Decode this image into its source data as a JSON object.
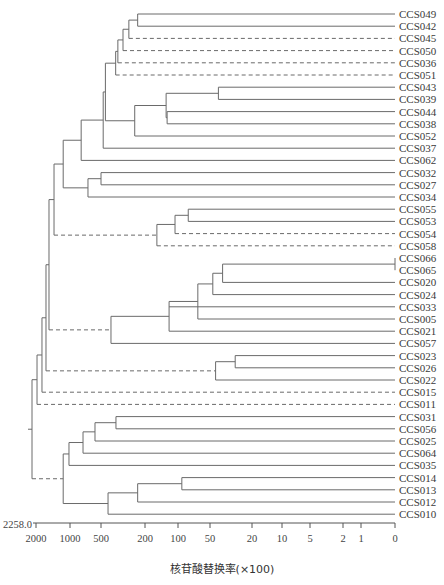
{
  "chart_data": {
    "type": "dendrogram",
    "title": "",
    "xlabel": "核苷酸替换率(×100)",
    "axis_max_label": "2258.0",
    "axis_ticks": [
      "2000",
      "1000",
      "500",
      "200",
      "100",
      "50",
      "20",
      "10",
      "5",
      "2",
      "1",
      "0"
    ],
    "leaves": [
      "CCS049",
      "CCS042",
      "CCS045",
      "CCS050",
      "CCS036",
      "CCS051",
      "CCS043",
      "CCS039",
      "CCS044",
      "CCS038",
      "CCS052",
      "CCS037",
      "CCS062",
      "CCS032",
      "CCS027",
      "CCS034",
      "CCS055",
      "CCS053",
      "CCS054",
      "CCS058",
      "CCS066",
      "CCS065",
      "CCS020",
      "CCS024",
      "CCS033",
      "CCS005",
      "CCS021",
      "CCS057",
      "CCS023",
      "CCS026",
      "CCS022",
      "CCS015",
      "CCS011",
      "CCS031",
      "CCS056",
      "CCS025",
      "CCS064",
      "CCS035",
      "CCS014",
      "CCS013",
      "CCS012",
      "CCS010"
    ],
    "tree": {
      "h": 2258,
      "c": [
        {
          "h": 1970,
          "c": [
            {
              "h": 1824,
              "c": [
                {
                  "h": 1706,
                  "c": [
                    {
                      "h": 1618,
                      "c": [
                        {
                          "h": 1470,
                          "c": [
                            {
                              "h": 1200,
                              "c": [
                                {
                                  "h": 820,
                                  "c": [
                                    {
                                      "h": 485,
                                      "c": [
                                        {
                                          "h": 470,
                                          "c": [
                                            {
                                              "h": 400,
                                              "c": [
                                                {
                                                  "h": 385,
                                                  "c": [
                                                    {
                                                      "h": 350,
                                                      "c": [
                                                        {
                                                          "h": 310,
                                                          "c": [
                                                            {
                                                              "h": 250,
                                                              "c": [
                                                                {
                                                                  "leaf": "CCS049"
                                                                },
                                                                {
                                                                  "leaf": "CCS042"
                                                                }
                                                              ]
                                                            },
                                                            {
                                                              "leaf": "CCS045",
                                                              "dashed": true
                                                            }
                                                          ]
                                                        },
                                                        {
                                                          "leaf": "CCS050",
                                                          "dashed": true
                                                        }
                                                      ]
                                                    },
                                                    {
                                                      "leaf": "CCS036",
                                                      "dashed": true
                                                    }
                                                  ]
                                                },
                                                {
                                                  "leaf": "CCS051",
                                                  "dashed": true
                                                }
                                              ]
                                            },
                                            {
                                              "h": 270,
                                              "c": [
                                                {
                                                  "h": 136,
                                                  "c": [
                                                    {
                                                      "h": 44,
                                                      "c": [
                                                        {
                                                          "leaf": "CCS043"
                                                        },
                                                        {
                                                          "leaf": "CCS039"
                                                        }
                                                      ]
                                                    },
                                                    {
                                                      "h": 133,
                                                      "c": [
                                                        {
                                                          "leaf": "CCS044"
                                                        },
                                                        {
                                                          "leaf": "CCS038"
                                                        }
                                                      ]
                                                    }
                                                  ]
                                                },
                                                {
                                                  "leaf": "CCS052"
                                                }
                                              ]
                                            }
                                          ]
                                        },
                                        {
                                          "leaf": "CCS037"
                                        }
                                      ]
                                    },
                                    {
                                      "leaf": "CCS062"
                                    }
                                  ]
                                },
                                {
                                  "h": 710,
                                  "c": [
                                    {
                                      "h": 500,
                                      "c": [
                                        {
                                          "leaf": "CCS032"
                                        },
                                        {
                                          "leaf": "CCS027"
                                        }
                                      ]
                                    },
                                    {
                                      "leaf": "CCS034"
                                    }
                                  ]
                                }
                              ]
                            },
                            {
                              "h": 164,
                              "dashed": true,
                              "c": [
                                {
                                  "h": 109,
                                  "c": [
                                    {
                                      "h": 84,
                                      "c": [
                                        {
                                          "leaf": "CCS055"
                                        },
                                        {
                                          "leaf": "CCS053"
                                        }
                                      ]
                                    },
                                    {
                                      "leaf": "CCS054",
                                      "dashed": true
                                    }
                                  ]
                                },
                                {
                                  "leaf": "CCS058",
                                  "dashed": true
                                }
                              ]
                            }
                          ]
                        },
                        {
                          "h": 432,
                          "dashed": true,
                          "c": [
                            {
                              "h": 127,
                              "c": [
                                {
                                  "h": 69,
                                  "c": [
                                    {
                                      "h": 48,
                                      "c": [
                                        {
                                          "h": 41,
                                          "c": [
                                            {
                                              "h": 0,
                                              "c": [
                                                {
                                                  "leaf": "CCS066"
                                                },
                                                {
                                                  "leaf": "CCS065"
                                                }
                                              ]
                                            },
                                            {
                                              "leaf": "CCS020"
                                            }
                                          ]
                                        },
                                        {
                                          "leaf": "CCS024"
                                        }
                                      ]
                                    },
                                    {
                                      "leaf": "CCS005"
                                    }
                                  ]
                                },
                                {
                                  "leaf": "CCS033"
                                },
                                {
                                  "leaf": "CCS021"
                                }
                              ]
                            },
                            {
                              "leaf": "CCS057"
                            }
                          ]
                        }
                      ]
                    },
                    {
                      "h": 46,
                      "dashed": true,
                      "c": [
                        {
                          "h": 32,
                          "c": [
                            {
                              "leaf": "CCS023"
                            },
                            {
                              "leaf": "CCS026"
                            }
                          ]
                        },
                        {
                          "leaf": "CCS022"
                        }
                      ]
                    }
                  ]
                },
                {
                  "leaf": "CCS015",
                  "dashed": true
                }
              ]
            },
            {
              "leaf": "CCS011",
              "dashed": true
            }
          ]
        },
        {
          "h": 1200,
          "dashed": true,
          "c": [
            {
              "h": 1030,
              "c": [
                {
                  "h": 790,
                  "c": [
                    {
                      "h": 597,
                      "c": [
                        {
                          "h": 398,
                          "c": [
                            {
                              "leaf": "CCS031"
                            },
                            {
                              "leaf": "CCS056"
                            }
                          ]
                        },
                        {
                          "leaf": "CCS025"
                        }
                      ]
                    },
                    {
                      "leaf": "CCS064"
                    }
                  ]
                },
                {
                  "leaf": "CCS035"
                }
              ]
            },
            {
              "h": 452,
              "c": [
                {
                  "h": 250,
                  "c": [
                    {
                      "h": 94,
                      "c": [
                        {
                          "leaf": "CCS014"
                        },
                        {
                          "leaf": "CCS013"
                        }
                      ]
                    },
                    {
                      "leaf": "CCS012"
                    }
                  ]
                },
                {
                  "leaf": "CCS010"
                }
              ]
            }
          ]
        }
      ]
    }
  }
}
